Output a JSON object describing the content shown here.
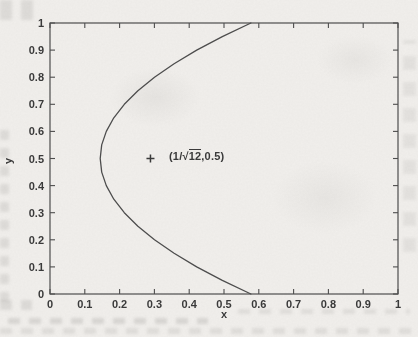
{
  "figure": {
    "paper_color": "#f1efec",
    "ink_color": "#4d4d4d",
    "text_color": "#3a3a3a",
    "style": "scanned-matlab-plot"
  },
  "chart_data": {
    "type": "line",
    "title": "",
    "xlabel": "x",
    "ylabel": "y",
    "xlim": [
      0,
      1
    ],
    "ylim": [
      0,
      1
    ],
    "grid": false,
    "xticks": [
      0,
      0.1,
      0.2,
      0.3,
      0.4,
      0.5,
      0.6,
      0.7,
      0.8,
      0.9,
      1
    ],
    "yticks": [
      0,
      0.1,
      0.2,
      0.3,
      0.4,
      0.5,
      0.6,
      0.7,
      0.8,
      0.9,
      1
    ],
    "series": [
      {
        "name": "rms-distance-curve",
        "points": [
          [
            0.5774,
            0.0
          ],
          [
            0.4951,
            0.05
          ],
          [
            0.4215,
            0.1
          ],
          [
            0.3565,
            0.15
          ],
          [
            0.3002,
            0.2
          ],
          [
            0.2526,
            0.25
          ],
          [
            0.2136,
            0.3
          ],
          [
            0.1833,
            0.35
          ],
          [
            0.1617,
            0.4
          ],
          [
            0.1487,
            0.45
          ],
          [
            0.1443,
            0.5
          ],
          [
            0.1487,
            0.55
          ],
          [
            0.1617,
            0.6
          ],
          [
            0.1833,
            0.65
          ],
          [
            0.2136,
            0.7
          ],
          [
            0.2526,
            0.75
          ],
          [
            0.3002,
            0.8
          ],
          [
            0.3565,
            0.85
          ],
          [
            0.4215,
            0.9
          ],
          [
            0.4951,
            0.95
          ],
          [
            0.5774,
            1.0
          ]
        ]
      }
    ],
    "annotation": {
      "marker": "+",
      "x": 0.2887,
      "y": 0.5,
      "label_pre": "(1/",
      "label_sqrt": "√",
      "label_radicand": "12",
      "label_post": ",0.5)"
    }
  }
}
